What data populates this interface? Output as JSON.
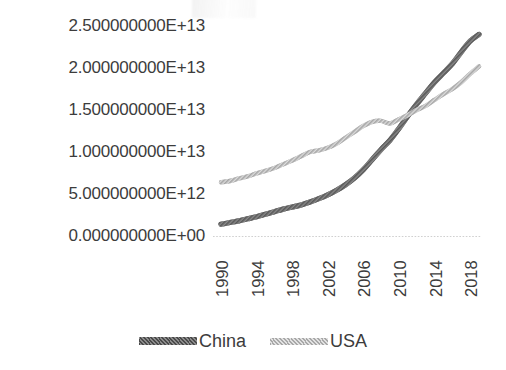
{
  "chart_data": {
    "type": "line",
    "title": "",
    "xlabel": "",
    "ylabel": "",
    "grid": false,
    "legend_position": "bottom",
    "x": [
      1990,
      1991,
      1992,
      1993,
      1994,
      1995,
      1996,
      1997,
      1998,
      1999,
      2000,
      2001,
      2002,
      2003,
      2004,
      2005,
      2006,
      2007,
      2008,
      2009,
      2010,
      2011,
      2012,
      2013,
      2014,
      2015,
      2016,
      2017,
      2018,
      2019
    ],
    "x_tick_labels": [
      "1990",
      "1994",
      "1998",
      "2002",
      "2006",
      "2010",
      "2014",
      "2018"
    ],
    "x_tick_values": [
      1990,
      1994,
      1998,
      2002,
      2006,
      2010,
      2014,
      2018
    ],
    "y_tick_labels": [
      "2.500000000E+13",
      "2.000000000E+13",
      "1.500000000E+13",
      "1.000000000E+13",
      "5.000000000E+12",
      "0.000000000E+00"
    ],
    "y_tick_values": [
      25000000000000,
      20000000000000,
      15000000000000,
      10000000000000,
      5000000000000,
      0
    ],
    "ylim": [
      0,
      25000000000000
    ],
    "xlim": [
      1990,
      2019
    ],
    "series": [
      {
        "name": "China",
        "color": "#595959",
        "values": [
          1400000000000,
          1600000000000,
          1800000000000,
          2050000000000,
          2300000000000,
          2600000000000,
          2900000000000,
          3200000000000,
          3450000000000,
          3700000000000,
          4050000000000,
          4450000000000,
          4900000000000,
          5450000000000,
          6100000000000,
          6900000000000,
          7900000000000,
          9100000000000,
          10300000000000,
          11400000000000,
          12800000000000,
          14300000000000,
          15700000000000,
          17000000000000,
          18300000000000,
          19400000000000,
          20500000000000,
          21900000000000,
          23200000000000,
          24000000000000
        ]
      },
      {
        "name": "USA",
        "color": "#a6a6a6",
        "values": [
          6400000000000,
          6550000000000,
          6850000000000,
          7100000000000,
          7450000000000,
          7750000000000,
          8100000000000,
          8550000000000,
          9000000000000,
          9500000000000,
          10000000000000,
          10200000000000,
          10500000000000,
          11000000000000,
          11700000000000,
          12400000000000,
          13100000000000,
          13600000000000,
          13700000000000,
          13400000000000,
          13900000000000,
          14400000000000,
          15000000000000,
          15500000000000,
          16200000000000,
          16900000000000,
          17500000000000,
          18300000000000,
          19300000000000,
          20200000000000
        ]
      }
    ],
    "legend": [
      {
        "label": "China",
        "swatch": "china-line-swatch"
      },
      {
        "label": "USA",
        "swatch": "usa-line-swatch"
      }
    ]
  }
}
